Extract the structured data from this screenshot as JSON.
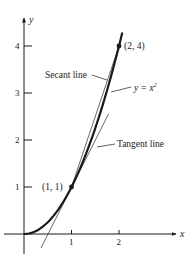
{
  "figure": {
    "colors": {
      "ink": "#1a1a1a",
      "thin": "#444444",
      "background": "#ffffff"
    },
    "axes": {
      "x_label": "x",
      "y_label": "y",
      "x_ticks": [
        {
          "value": 1,
          "label": "1"
        },
        {
          "value": 2,
          "label": "2"
        }
      ],
      "y_ticks": [
        {
          "value": 1,
          "label": "1"
        },
        {
          "value": 2,
          "label": "2"
        },
        {
          "value": 3,
          "label": "3"
        },
        {
          "value": 4,
          "label": "4"
        }
      ]
    },
    "curve": {
      "equation": "y = x²",
      "label": "y = x",
      "label_sup": "2",
      "x_range": [
        0,
        2.07
      ]
    },
    "points": [
      {
        "x": 1,
        "y": 1,
        "label": "(1, 1)"
      },
      {
        "x": 2,
        "y": 4,
        "label": "(2, 4)"
      }
    ],
    "secant_line": {
      "label": "Secant line",
      "through": [
        [
          1,
          1
        ],
        [
          2,
          4
        ]
      ]
    },
    "tangent_line": {
      "label": "Tangent line",
      "slope": 2,
      "intercept": -1,
      "x_range": [
        0.36,
        1.78
      ]
    }
  }
}
